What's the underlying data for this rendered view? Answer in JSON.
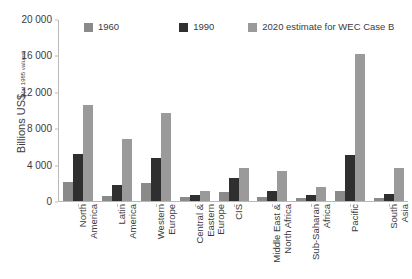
{
  "chart_data": {
    "type": "bar",
    "title": "",
    "xlabel": "",
    "ylabel": "Billions US$ (at 1985 values)",
    "ylabel_main": "Billions US$",
    "ylabel_sub": "(at 1985 values)",
    "ylim": [
      0,
      20000
    ],
    "yticks": [
      0,
      4000,
      8000,
      12000,
      16000,
      20000
    ],
    "ytick_labels": [
      "0",
      "4 000",
      "8 000",
      "12 000",
      "16 000",
      "20 000"
    ],
    "grid": false,
    "legend_position": "top",
    "categories": [
      "North America",
      "Latin America",
      "Western Europe",
      "Central & Eastern Europe",
      "CIS",
      "Middle East & North Africa",
      "Sub-Saharan Africa",
      "Pacific",
      "South Asia"
    ],
    "category_lines": [
      [
        "North",
        "America"
      ],
      [
        "Latin",
        "America"
      ],
      [
        "Western",
        "Europe"
      ],
      [
        "Central &",
        "Eastern",
        "Europe"
      ],
      [
        "CIS"
      ],
      [
        "Middle East &",
        "North Africa"
      ],
      [
        "Sub-Saharan",
        "Africa"
      ],
      [
        "Pacific"
      ],
      [
        "South",
        "Asia"
      ]
    ],
    "series": [
      {
        "name": "1960",
        "color": "#8a8a8a",
        "values": [
          2100,
          500,
          2000,
          400,
          1000,
          400,
          300,
          1100,
          300
        ]
      },
      {
        "name": "1990",
        "color": "#2f2f2f",
        "values": [
          5200,
          1800,
          4800,
          700,
          2500,
          1100,
          700,
          5100,
          800
        ]
      },
      {
        "name": "2020 estimate for WEC Case B",
        "color": "#9a9a9a",
        "values": [
          10600,
          6900,
          9700,
          1100,
          3700,
          3300,
          1600,
          16200,
          3700
        ]
      }
    ]
  },
  "legend": {
    "entries": [
      {
        "label": "1960",
        "color": "#8a8a8a"
      },
      {
        "label": "1990",
        "color": "#2f2f2f"
      },
      {
        "label": "2020 estimate for WEC Case B",
        "color": "#9a9a9a"
      }
    ]
  },
  "colors": {
    "axis": "#b9b9b9",
    "text": "#3b3b3b",
    "background": "#ffffff"
  }
}
